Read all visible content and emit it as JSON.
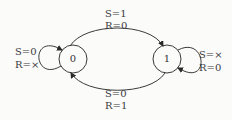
{
  "diagram": {
    "type": "state-transition",
    "states": [
      {
        "id": "s0",
        "label": "0"
      },
      {
        "id": "s1",
        "label": "1"
      }
    ],
    "transitions": [
      {
        "from": "0",
        "to": "1",
        "label_line1": "S=1",
        "label_line2": "R=0",
        "position": "top"
      },
      {
        "from": "1",
        "to": "0",
        "label_line1": "S=0",
        "label_line2": "R=1",
        "position": "bottom"
      },
      {
        "from": "0",
        "to": "0",
        "label_line1": "S=0",
        "label_line2": "R=×",
        "position": "left-loop"
      },
      {
        "from": "1",
        "to": "1",
        "label_line1": "S=×",
        "label_line2": "R=0",
        "position": "right-loop"
      }
    ]
  },
  "colors": {
    "stroke": "#3a3a3a",
    "background": "#fbfbfa"
  }
}
